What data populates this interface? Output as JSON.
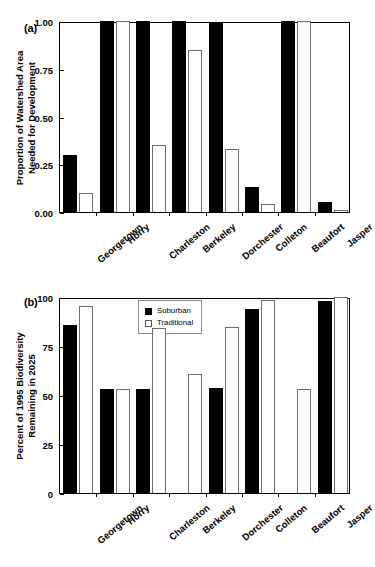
{
  "figure": {
    "cut_off_header": "",
    "panel_a_label": "(a)",
    "panel_b_label": "(b)"
  },
  "legend": {
    "suburban_label": "Suburban",
    "traditional_label": "Traditional",
    "suburban_swatch": "filled-square-icon",
    "traditional_swatch": "open-square-icon"
  },
  "chart_data": [
    {
      "id": "panel-a",
      "type": "bar",
      "title": "(a)",
      "xlabel": "",
      "ylabel": "Proportion of Watershed Area Needed for Development",
      "ylabel_line1": "Proportion of Watershed Area",
      "ylabel_line2": "Needed for Development",
      "ylim": [
        0.0,
        1.0
      ],
      "yticks": [
        0.0,
        0.25,
        0.5,
        0.75,
        1.0
      ],
      "ytick_labels": [
        "0.00",
        "0.25",
        "0.50",
        "0.75",
        "1.00"
      ],
      "grid": false,
      "legend_position": "none",
      "categories": [
        "Georgetown",
        "Horry",
        "Charleston",
        "Berkeley",
        "Dorchester",
        "Colleton",
        "Beaufort",
        "Jasper"
      ],
      "series": [
        {
          "name": "Suburban",
          "color": "#000000",
          "values": [
            0.3,
            1.0,
            1.0,
            1.0,
            0.99,
            0.13,
            1.0,
            0.05
          ]
        },
        {
          "name": "Traditional",
          "color": "#ffffff",
          "values": [
            0.1,
            1.0,
            0.35,
            0.85,
            0.33,
            0.04,
            1.0,
            0.01
          ]
        }
      ]
    },
    {
      "id": "panel-b",
      "type": "bar",
      "title": "(b)",
      "xlabel": "",
      "ylabel": "Percent of 1995 Biodiversity Remaining in 2025",
      "ylabel_line1": "Percent of 1995 Biodiversity",
      "ylabel_line2": "Remaining in 2025",
      "ylim": [
        0,
        100
      ],
      "yticks": [
        0,
        25,
        50,
        75,
        100
      ],
      "ytick_labels": [
        "0",
        "25",
        "50",
        "75",
        "100"
      ],
      "grid": false,
      "legend_position": "top-center",
      "categories": [
        "Georgetown",
        "Horry",
        "Charleston",
        "Berkeley",
        "Dorchester",
        "Colleton",
        "Beaufort",
        "Jasper"
      ],
      "series": [
        {
          "name": "Suburban",
          "color": "#000000",
          "values": [
            85.5,
            53.0,
            53.0,
            0,
            53.5,
            94.0,
            0,
            98.0
          ]
        },
        {
          "name": "Traditional",
          "color": "#ffffff",
          "values": [
            95.5,
            53.0,
            84.0,
            60.5,
            84.5,
            98.5,
            53.0,
            100.0
          ]
        }
      ]
    }
  ]
}
